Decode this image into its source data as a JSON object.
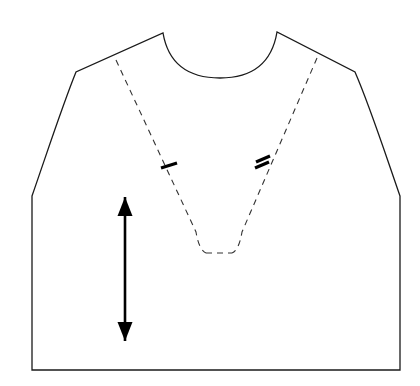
{
  "document": {
    "title": "Bodice Front Pattern Piece",
    "type": "sewing-pattern-technical-drawing",
    "canvas": {
      "width": 420,
      "height": 386,
      "background": "#ffffff"
    }
  },
  "style": {
    "outline_color": "#1a1a1a",
    "outline_width": 1.3,
    "dashed_color": "#333333",
    "dashed_width": 1.1,
    "dash_pattern": "6 5",
    "notch_color": "#000000",
    "notch_width": 3.2,
    "grainline_color": "#000000",
    "grainline_width": 2.6
  },
  "shapes": {
    "body_outline": {
      "name": "bodice-outline",
      "description": "Closed outline of the bodice front: neckline, shoulders, armholes, side seams, hem",
      "path": "M 163 33 C 168 62, 187 78, 220 78 C 253 78, 272 62, 277 32 L 355 72 C 369 104, 382 144, 400 196 L 400 370 L 32 370 L 32 196 C 50 144, 63 104, 76 72 Z"
    },
    "neckline": {
      "name": "neckline-curve",
      "left_point": [
        163,
        33
      ],
      "right_point": [
        277,
        32
      ],
      "lowest_point": [
        220,
        78
      ]
    },
    "shoulder_left": {
      "name": "left-shoulder-seam",
      "from": [
        163,
        33
      ],
      "to": [
        76,
        72
      ]
    },
    "shoulder_right": {
      "name": "right-shoulder-seam",
      "from": [
        277,
        32
      ],
      "to": [
        355,
        72
      ]
    },
    "armhole_left": {
      "name": "left-armhole-curve",
      "from": [
        76,
        72
      ],
      "to": [
        32,
        196
      ]
    },
    "armhole_right": {
      "name": "right-armhole-curve",
      "from": [
        355,
        72
      ],
      "to": [
        400,
        196
      ]
    },
    "side_seam_left": {
      "name": "left-side-seam",
      "from": [
        32,
        196
      ],
      "to": [
        32,
        370
      ]
    },
    "side_seam_right": {
      "name": "right-side-seam",
      "from": [
        400,
        196
      ],
      "to": [
        400,
        370
      ]
    },
    "hem": {
      "name": "hem-line",
      "from": [
        32,
        370
      ],
      "to": [
        400,
        370
      ]
    },
    "dashed_v_left": {
      "name": "left-dashed-seam-line",
      "path": "M 116 60 L 196 232 Q 199 250, 206 253"
    },
    "dashed_v_right": {
      "name": "right-dashed-seam-line",
      "path": "M 317 58 L 242 232 Q 239 250, 232 253"
    },
    "dashed_v_base": {
      "name": "v-notch-base-line",
      "path": "M 206 253 L 232 253"
    }
  },
  "markings": {
    "notch_single": {
      "name": "single-notch-mark",
      "label": "single notch",
      "count": 1,
      "center": [
        169,
        166
      ],
      "strokes": [
        {
          "from": [
            161,
            168
          ],
          "to": [
            177,
            163
          ]
        }
      ]
    },
    "notch_double": {
      "name": "double-notch-mark",
      "label": "double notch",
      "count": 2,
      "center": [
        262,
        164
      ],
      "strokes": [
        {
          "from": [
            255,
            168
          ],
          "to": [
            269,
            162
          ]
        },
        {
          "from": [
            256,
            162
          ],
          "to": [
            270,
            156
          ]
        }
      ]
    },
    "grainline": {
      "name": "grainline-arrow",
      "label": "grainline",
      "orientation": "vertical",
      "x": 125,
      "top": 197,
      "bottom": 341,
      "head_width": 15,
      "head_length": 19
    }
  }
}
